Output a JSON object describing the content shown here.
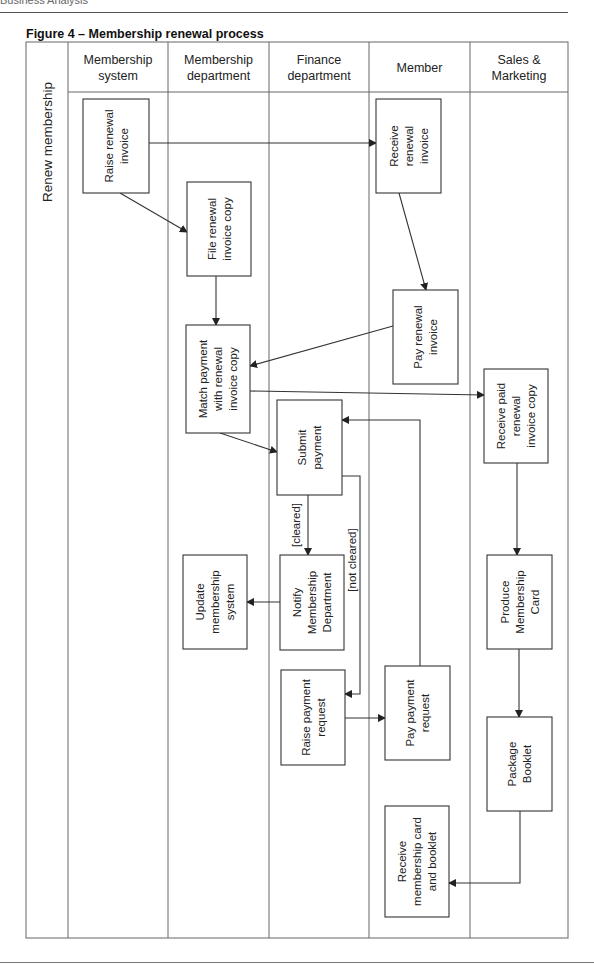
{
  "page": {
    "running_header": "Business Analysis",
    "figure_title": "Figure 4 – Membership renewal process"
  },
  "pool": {
    "label": "Renew membership"
  },
  "lanes": [
    {
      "id": "membership-system",
      "label_lines": [
        "Membership",
        "system"
      ]
    },
    {
      "id": "membership-department",
      "label_lines": [
        "Membership",
        "department"
      ]
    },
    {
      "id": "finance-department",
      "label_lines": [
        "Finance",
        "department"
      ]
    },
    {
      "id": "member",
      "label_lines": [
        "Member"
      ]
    },
    {
      "id": "sales-marketing",
      "label_lines": [
        "Sales &",
        "Marketing"
      ]
    }
  ],
  "activities": [
    {
      "id": "raise-renewal-invoice",
      "lane": "membership-system",
      "lines": [
        "Raise renewal",
        "invoice"
      ]
    },
    {
      "id": "file-renewal-invoice-copy",
      "lane": "membership-department",
      "lines": [
        "File renewal",
        "invoice copy"
      ]
    },
    {
      "id": "receive-renewal-invoice",
      "lane": "member",
      "lines": [
        "Receive",
        "renewal",
        "invoice"
      ]
    },
    {
      "id": "pay-renewal-invoice",
      "lane": "member",
      "lines": [
        "Pay renewal",
        "invoice"
      ]
    },
    {
      "id": "match-payment",
      "lane": "membership-department",
      "lines": [
        "Match payment",
        "with renewal",
        "invoice copy"
      ]
    },
    {
      "id": "receive-paid-renewal-invoice-copy",
      "lane": "sales-marketing",
      "lines": [
        "Receive paid",
        "renewal",
        "invoice copy"
      ]
    },
    {
      "id": "submit-payment",
      "lane": "finance-department",
      "lines": [
        "Submit",
        "payment"
      ]
    },
    {
      "id": "notify-membership-department",
      "lane": "finance-department",
      "lines": [
        "Notify",
        "Membership",
        "Department"
      ]
    },
    {
      "id": "update-membership-system",
      "lane": "membership-department",
      "lines": [
        "Update",
        "membership",
        "system"
      ]
    },
    {
      "id": "produce-membership-card",
      "lane": "sales-marketing",
      "lines": [
        "Produce",
        "Membership",
        "Card"
      ]
    },
    {
      "id": "raise-payment-request",
      "lane": "finance-department",
      "lines": [
        "Raise payment",
        "request"
      ]
    },
    {
      "id": "pay-payment-request",
      "lane": "member",
      "lines": [
        "Pay payment",
        "request"
      ]
    },
    {
      "id": "package-booklet",
      "lane": "sales-marketing",
      "lines": [
        "Package",
        "Booklet"
      ]
    },
    {
      "id": "receive-membership-card-and-booklet",
      "lane": "member",
      "lines": [
        "Receive",
        "membership card",
        "and booklet"
      ]
    }
  ],
  "flows": [
    {
      "from": "raise-renewal-invoice",
      "to": "receive-renewal-invoice",
      "label": ""
    },
    {
      "from": "raise-renewal-invoice",
      "to": "file-renewal-invoice-copy",
      "label": ""
    },
    {
      "from": "file-renewal-invoice-copy",
      "to": "match-payment",
      "label": ""
    },
    {
      "from": "receive-renewal-invoice",
      "to": "pay-renewal-invoice",
      "label": ""
    },
    {
      "from": "pay-renewal-invoice",
      "to": "match-payment",
      "label": ""
    },
    {
      "from": "match-payment",
      "to": "receive-paid-renewal-invoice-copy",
      "label": ""
    },
    {
      "from": "match-payment",
      "to": "submit-payment",
      "label": ""
    },
    {
      "from": "submit-payment",
      "to": "notify-membership-department",
      "label": "[cleared]"
    },
    {
      "from": "submit-payment",
      "to": "raise-payment-request",
      "label": "[not cleared]"
    },
    {
      "from": "notify-membership-department",
      "to": "update-membership-system",
      "label": ""
    },
    {
      "from": "raise-payment-request",
      "to": "pay-payment-request",
      "label": ""
    },
    {
      "from": "pay-payment-request",
      "to": "submit-payment",
      "label": ""
    },
    {
      "from": "receive-paid-renewal-invoice-copy",
      "to": "produce-membership-card",
      "label": ""
    },
    {
      "from": "produce-membership-card",
      "to": "package-booklet",
      "label": ""
    },
    {
      "from": "package-booklet",
      "to": "receive-membership-card-and-booklet",
      "label": ""
    }
  ],
  "colors": {
    "stroke": "#333333",
    "grid": "#666666",
    "text": "#222222"
  }
}
